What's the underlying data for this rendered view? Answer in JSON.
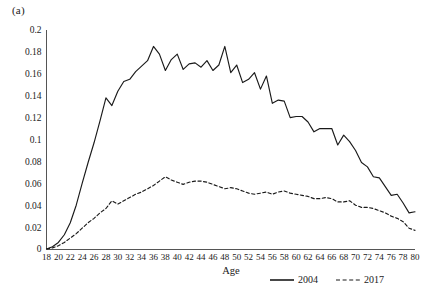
{
  "figure": {
    "panel_label": "(a)",
    "background_color": "#ffffff",
    "line_color": "#1a1a1a"
  },
  "chart_data": {
    "type": "line",
    "title": "",
    "subtitle": "",
    "xlabel": "Age",
    "ylabel": "",
    "xlim": [
      18,
      80
    ],
    "ylim": [
      0,
      0.2
    ],
    "grid": false,
    "legend_position": "bottom",
    "x_tick_labels": [
      "18",
      "20",
      "22",
      "24",
      "26",
      "28",
      "30",
      "32",
      "34",
      "36",
      "38",
      "40",
      "42",
      "44",
      "46",
      "48",
      "50",
      "52",
      "54",
      "56",
      "58",
      "60",
      "62",
      "64",
      "66",
      "68",
      "70",
      "72",
      "74",
      "76",
      "78",
      "80"
    ],
    "y_tick_labels": [
      "0",
      "0.02",
      "0.04",
      "0.06",
      "0.08",
      "0.1",
      "0.12",
      "0.14",
      "0.16",
      "0.18",
      "0.2"
    ],
    "y_tick_values": [
      0,
      0.02,
      0.04,
      0.06,
      0.08,
      0.1,
      0.12,
      0.14,
      0.16,
      0.18,
      0.2
    ],
    "x": [
      18,
      19,
      20,
      21,
      22,
      23,
      24,
      25,
      26,
      27,
      28,
      29,
      30,
      31,
      32,
      33,
      34,
      35,
      36,
      37,
      38,
      39,
      40,
      41,
      42,
      43,
      44,
      45,
      46,
      47,
      48,
      49,
      50,
      51,
      52,
      53,
      54,
      55,
      56,
      57,
      58,
      59,
      60,
      61,
      62,
      63,
      64,
      65,
      66,
      67,
      68,
      69,
      70,
      71,
      72,
      73,
      74,
      75,
      76,
      77,
      78,
      79,
      80
    ],
    "series": [
      {
        "name": "2004",
        "style": "solid",
        "color": "#1a1a1a",
        "values": [
          0.0,
          0.002,
          0.006,
          0.013,
          0.024,
          0.04,
          0.06,
          0.079,
          0.097,
          0.117,
          0.138,
          0.131,
          0.144,
          0.153,
          0.155,
          0.162,
          0.167,
          0.172,
          0.185,
          0.178,
          0.163,
          0.173,
          0.178,
          0.164,
          0.169,
          0.17,
          0.166,
          0.172,
          0.163,
          0.168,
          0.185,
          0.161,
          0.168,
          0.152,
          0.155,
          0.161,
          0.146,
          0.158,
          0.133,
          0.136,
          0.135,
          0.12,
          0.121,
          0.121,
          0.116,
          0.107,
          0.11,
          0.11,
          0.11,
          0.095,
          0.104,
          0.098,
          0.09,
          0.079,
          0.075,
          0.066,
          0.065,
          0.057,
          0.049,
          0.05,
          0.042,
          0.033,
          0.034
        ]
      },
      {
        "name": "2017",
        "style": "dashed",
        "color": "#1a1a1a",
        "values": [
          0.0,
          0.001,
          0.003,
          0.006,
          0.01,
          0.014,
          0.019,
          0.024,
          0.028,
          0.033,
          0.037,
          0.044,
          0.041,
          0.044,
          0.047,
          0.05,
          0.052,
          0.055,
          0.058,
          0.062,
          0.066,
          0.063,
          0.061,
          0.059,
          0.061,
          0.062,
          0.062,
          0.061,
          0.059,
          0.057,
          0.055,
          0.056,
          0.055,
          0.053,
          0.051,
          0.05,
          0.051,
          0.052,
          0.05,
          0.052,
          0.053,
          0.051,
          0.05,
          0.049,
          0.048,
          0.046,
          0.046,
          0.047,
          0.046,
          0.043,
          0.043,
          0.044,
          0.04,
          0.038,
          0.038,
          0.037,
          0.035,
          0.033,
          0.03,
          0.028,
          0.025,
          0.019,
          0.017
        ]
      }
    ],
    "legend": [
      {
        "label": "2004",
        "style": "solid"
      },
      {
        "label": "2017",
        "style": "dashed"
      }
    ]
  }
}
